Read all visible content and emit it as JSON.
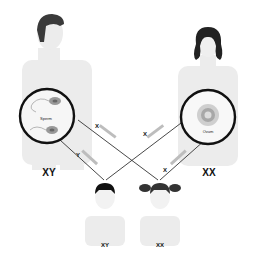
{
  "diagram": {
    "father": {
      "genotype": "XY",
      "cell_label": "Sperm"
    },
    "mother": {
      "genotype": "XX",
      "cell_label": "Ovum"
    },
    "son": {
      "genotype": "XY"
    },
    "daughter": {
      "genotype": "XX"
    },
    "arrows": [
      {
        "from": "father",
        "to": "son",
        "label": "Y chromosome"
      },
      {
        "from": "father",
        "to": "daughter",
        "label": "X chromosome"
      },
      {
        "from": "mother",
        "to": "son",
        "label": "X chromosome"
      },
      {
        "from": "mother",
        "to": "daughter",
        "label": "X chromosome"
      }
    ],
    "colors": {
      "body": "#ececec",
      "hair": "#3a3a3a",
      "circle": "#111111",
      "line": "#333333",
      "label_band": "#bdbdbd"
    }
  }
}
